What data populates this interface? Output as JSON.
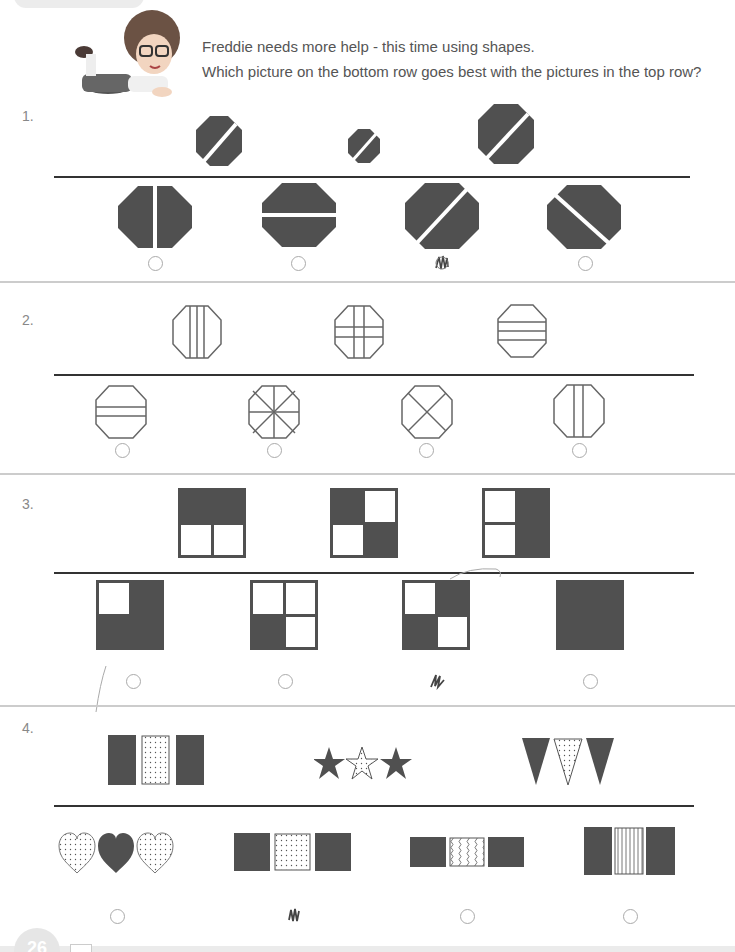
{
  "header": {
    "line1": "Freddie needs more help - this time using shapes.",
    "line2": "Which picture on the bottom row goes best with the pictures in the top row?"
  },
  "colors": {
    "fill": "#505050",
    "outline": "#666666",
    "rule": "#333333",
    "separator": "#cccccc"
  },
  "questions": [
    {
      "number": "1.",
      "top_row": [
        "dark-octagon-diagonal-slash",
        "small-dark-octagon-diagonal-slash",
        "large-dark-octagon-diagonal-slash"
      ],
      "options": [
        {
          "shape": "dark-octagon-vertical-split",
          "marked": false
        },
        {
          "shape": "dark-octagon-horizontal-split",
          "marked": false
        },
        {
          "shape": "dark-octagon-diagonal-slash",
          "marked": true
        },
        {
          "shape": "dark-octagon-backslash",
          "marked": false
        }
      ]
    },
    {
      "number": "2.",
      "top_row": [
        "octagon-three-vertical-lines",
        "octagon-grid-lines",
        "octagon-three-horizontal-lines"
      ],
      "options": [
        {
          "shape": "octagon-two-horizontal-lines",
          "marked": false
        },
        {
          "shape": "octagon-star-lines",
          "marked": false
        },
        {
          "shape": "octagon-cross-diagonals",
          "marked": false
        },
        {
          "shape": "octagon-two-vertical-lines",
          "marked": false
        }
      ]
    },
    {
      "number": "3.",
      "top_row": [
        "square-top-half-dark",
        "square-diagonal-quarters-dark",
        "square-right-half-dark"
      ],
      "options": [
        {
          "shape": "square-three-quarters-dark",
          "marked": false
        },
        {
          "shape": "square-one-quarter-dark",
          "marked": false
        },
        {
          "shape": "square-two-quarters-dark-diagonal",
          "marked": true
        },
        {
          "shape": "square-all-dark",
          "marked": false
        }
      ]
    },
    {
      "number": "4.",
      "top_row": [
        "rectangles-dark-dotted-dark",
        "stars-dark-dotted-dark",
        "triangles-dark-dotted-dark"
      ],
      "options": [
        {
          "shape": "hearts-dotted-dark-dotted",
          "marked": false
        },
        {
          "shape": "squares-dark-dotted-dark",
          "marked": true
        },
        {
          "shape": "rectangles-dark-wavy-dark",
          "marked": false
        },
        {
          "shape": "rectangles-dark-striped-dark",
          "marked": false
        }
      ]
    }
  ],
  "footer": {
    "page_number": "26"
  }
}
